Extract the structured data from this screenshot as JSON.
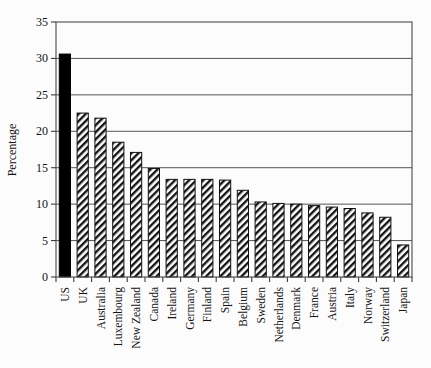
{
  "chart_data": {
    "type": "bar",
    "title": "",
    "subtitle": "",
    "xlabel": "",
    "ylabel": "Percentage",
    "ylim": [
      0,
      35
    ],
    "ytick_values": [
      0,
      5,
      10,
      15,
      20,
      25,
      30,
      35
    ],
    "ytick_labels": [
      "0",
      "5",
      "10",
      "15",
      "20",
      "25",
      "30",
      "35"
    ],
    "grid": true,
    "grid_axis": "y",
    "legend": "none",
    "categories": [
      "US",
      "UK",
      "Australia",
      "Luxembourg",
      "New Zealand",
      "Canada",
      "Ireland",
      "Germany",
      "Finland",
      "Spain",
      "Belgium",
      "Sweden",
      "Netherlands",
      "Denmark",
      "France",
      "Austria",
      "Italy",
      "Norway",
      "Switzerland",
      "Japan"
    ],
    "values": [
      30.6,
      22.5,
      21.8,
      18.5,
      17.1,
      14.9,
      13.4,
      13.4,
      13.4,
      13.3,
      11.9,
      10.3,
      10.1,
      10.0,
      9.8,
      9.6,
      9.4,
      8.8,
      8.2,
      4.4
    ],
    "highlight_index": 0,
    "bar_styles": {
      "default": "diagonal-hatch",
      "highlight": "solid-black"
    },
    "colors": {
      "bar_outline": "#111111",
      "bar_highlight_fill": "#000000",
      "bar_hatch_fill": "#ffffff",
      "grid": "#555555",
      "frame": "#4a4a4a",
      "text": "#151515",
      "background": "#fcfcfc"
    }
  }
}
